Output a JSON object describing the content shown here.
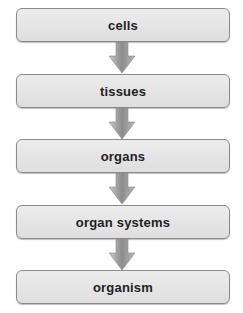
{
  "diagram": {
    "type": "flowchart",
    "direction": "top-to-bottom",
    "steps": [
      {
        "label": "cells"
      },
      {
        "label": "tissues"
      },
      {
        "label": "organs"
      },
      {
        "label": "organ systems"
      },
      {
        "label": "organism"
      }
    ],
    "colors": {
      "box_fill": "#e4e4e4",
      "box_border": "#8a8a8a",
      "arrow_fill": "#9a9a9a",
      "text": "#222222"
    }
  }
}
